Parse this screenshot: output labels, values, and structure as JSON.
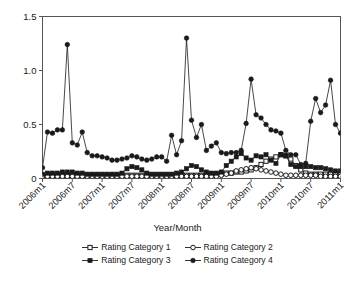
{
  "chart_data": {
    "type": "line",
    "title": "",
    "xlabel": "Year/Month",
    "ylabel": "",
    "ylim": [
      0,
      1.5
    ],
    "yticks": [
      0,
      0.5,
      1.0,
      1.5
    ],
    "ytick_labels": [
      "0",
      "0.5",
      "1.0",
      "1.5"
    ],
    "grid": false,
    "legend_position": "bottom",
    "xtick_labels": [
      "2006m1",
      "2006m7",
      "2007m1",
      "2007m7",
      "2008m1",
      "2008m7",
      "2009m1",
      "2009m7",
      "2010m1",
      "2010m7",
      "2011m1"
    ],
    "xtick_indices": [
      0,
      6,
      12,
      18,
      24,
      30,
      36,
      42,
      48,
      54,
      60
    ],
    "x": [
      "2006m1",
      "2006m2",
      "2006m3",
      "2006m4",
      "2006m5",
      "2006m6",
      "2006m7",
      "2006m8",
      "2006m9",
      "2006m10",
      "2006m11",
      "2006m12",
      "2007m1",
      "2007m2",
      "2007m3",
      "2007m4",
      "2007m5",
      "2007m6",
      "2007m7",
      "2007m8",
      "2007m9",
      "2007m10",
      "2007m11",
      "2007m12",
      "2008m1",
      "2008m2",
      "2008m3",
      "2008m4",
      "2008m5",
      "2008m6",
      "2008m7",
      "2008m8",
      "2008m9",
      "2008m10",
      "2008m11",
      "2008m12",
      "2009m1",
      "2009m2",
      "2009m3",
      "2009m4",
      "2009m5",
      "2009m6",
      "2009m7",
      "2009m8",
      "2009m9",
      "2009m10",
      "2009m11",
      "2009m12",
      "2010m1",
      "2010m2",
      "2010m3",
      "2010m4",
      "2010m5",
      "2010m6",
      "2010m7",
      "2010m8",
      "2010m9",
      "2010m10",
      "2010m11",
      "2010m12",
      "2011m1"
    ],
    "series": [
      {
        "name": "Rating Category 1",
        "marker": "open-square",
        "color": "#1a1a1a",
        "values": [
          0.02,
          0.03,
          0.03,
          0.03,
          0.03,
          0.03,
          0.03,
          0.03,
          0.03,
          0.03,
          0.03,
          0.03,
          0.03,
          0.03,
          0.03,
          0.03,
          0.03,
          0.03,
          0.03,
          0.03,
          0.03,
          0.03,
          0.03,
          0.03,
          0.03,
          0.03,
          0.03,
          0.03,
          0.03,
          0.03,
          0.03,
          0.03,
          0.03,
          0.04,
          0.04,
          0.04,
          0.04,
          0.05,
          0.05,
          0.06,
          0.06,
          0.07,
          0.08,
          0.1,
          0.13,
          0.16,
          0.18,
          0.2,
          0.22,
          0.21,
          0.18,
          0.12,
          0.08,
          0.05,
          0.04,
          0.04,
          0.04,
          0.04,
          0.04,
          0.04,
          0.04
        ]
      },
      {
        "name": "Rating Category 2",
        "marker": "open-circle",
        "color": "#1a1a1a",
        "values": [
          0.02,
          0.02,
          0.02,
          0.02,
          0.02,
          0.02,
          0.02,
          0.02,
          0.02,
          0.02,
          0.02,
          0.02,
          0.02,
          0.02,
          0.02,
          0.02,
          0.02,
          0.02,
          0.02,
          0.02,
          0.02,
          0.02,
          0.02,
          0.02,
          0.02,
          0.02,
          0.02,
          0.02,
          0.02,
          0.02,
          0.02,
          0.02,
          0.02,
          0.02,
          0.02,
          0.02,
          0.03,
          0.04,
          0.05,
          0.07,
          0.08,
          0.09,
          0.1,
          0.09,
          0.08,
          0.07,
          0.06,
          0.05,
          0.04,
          0.03,
          0.03,
          0.03,
          0.03,
          0.03,
          0.03,
          0.03,
          0.02,
          0.02,
          0.02,
          0.02,
          0.02
        ]
      },
      {
        "name": "Rating Category 3",
        "marker": "filled-square",
        "color": "#1a1a1a",
        "values": [
          0.04,
          0.05,
          0.05,
          0.05,
          0.06,
          0.06,
          0.06,
          0.05,
          0.05,
          0.04,
          0.04,
          0.04,
          0.04,
          0.04,
          0.04,
          0.04,
          0.05,
          0.09,
          0.11,
          0.1,
          0.08,
          0.05,
          0.04,
          0.04,
          0.04,
          0.04,
          0.04,
          0.05,
          0.06,
          0.09,
          0.12,
          0.11,
          0.08,
          0.06,
          0.05,
          0.05,
          0.06,
          0.12,
          0.16,
          0.2,
          0.23,
          0.19,
          0.17,
          0.21,
          0.2,
          0.22,
          0.17,
          0.14,
          0.22,
          0.21,
          0.13,
          0.11,
          0.11,
          0.11,
          0.11,
          0.1,
          0.1,
          0.09,
          0.08,
          0.07,
          0.07
        ]
      },
      {
        "name": "Rating Category 4",
        "marker": "filled-circle",
        "color": "#1a1a1a",
        "values": [
          0.1,
          0.43,
          0.42,
          0.45,
          0.45,
          1.24,
          0.33,
          0.31,
          0.43,
          0.24,
          0.21,
          0.21,
          0.2,
          0.19,
          0.17,
          0.17,
          0.18,
          0.19,
          0.21,
          0.2,
          0.18,
          0.17,
          0.18,
          0.2,
          0.2,
          0.16,
          0.4,
          0.22,
          0.35,
          1.3,
          0.54,
          0.38,
          0.5,
          0.26,
          0.3,
          0.33,
          0.24,
          0.23,
          0.24,
          0.24,
          0.26,
          0.51,
          0.92,
          0.59,
          0.56,
          0.5,
          0.45,
          0.44,
          0.42,
          0.26,
          0.22,
          0.22,
          0.13,
          0.14,
          0.53,
          0.74,
          0.61,
          0.68,
          0.91,
          0.5,
          0.42
        ]
      }
    ]
  },
  "legend": {
    "rows": [
      [
        {
          "label": "Rating Category 1",
          "marker": "open-square"
        },
        {
          "label": "Rating Category 2",
          "marker": "open-circle"
        }
      ],
      [
        {
          "label": "Rating Category 3",
          "marker": "filled-square"
        },
        {
          "label": "Rating Category 4",
          "marker": "filled-circle"
        }
      ]
    ]
  },
  "axes": {
    "frame_color": "#555555",
    "tick_color": "#555555",
    "line_color": "#1a1a1a"
  }
}
